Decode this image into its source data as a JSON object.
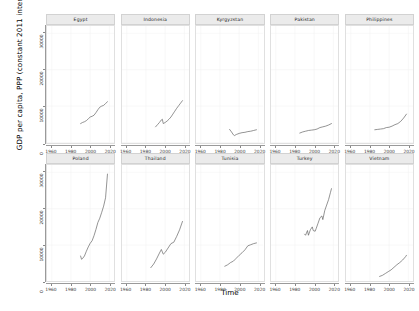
{
  "chart_data": {
    "type": "line",
    "title": "",
    "subtitle": "",
    "xlabel": "Time",
    "ylabel": "GDP per capita, PPP (constant 2011 international $)",
    "xlim": [
      1955,
      2025
    ],
    "ylim": [
      0,
      32000
    ],
    "grid": true,
    "legend": "none",
    "facet_layout": {
      "rows": 2,
      "cols": 5
    },
    "yticks": [
      0,
      10000,
      20000,
      30000
    ],
    "ytick_labels": [
      "0",
      "10000",
      "20000",
      "30000"
    ],
    "xticks": [
      1960,
      1980,
      2000,
      2020
    ],
    "xtick_labels": [
      "1960",
      "1980",
      "2000",
      "2020"
    ],
    "line_color": "#5a5a5a",
    "strip_color": "#ebebeb",
    "panels": [
      {
        "label": "Egypt",
        "x": [
          1990,
          1992,
          1994,
          1996,
          1998,
          2000,
          2002,
          2004,
          2006,
          2008,
          2010,
          2012,
          2014,
          2016,
          2018
        ],
        "y": [
          5200,
          5500,
          5700,
          6000,
          6500,
          7000,
          7200,
          7500,
          8200,
          9000,
          9700,
          10000,
          10200,
          10700,
          11200
        ]
      },
      {
        "label": "Indonesia",
        "x": [
          1990,
          1992,
          1994,
          1996,
          1997,
          1998,
          2000,
          2002,
          2004,
          2006,
          2008,
          2010,
          2012,
          2014,
          2016,
          2018
        ],
        "y": [
          4300,
          4900,
          5500,
          6200,
          6400,
          5200,
          5500,
          5900,
          6400,
          7000,
          7800,
          8600,
          9400,
          10100,
          10800,
          11500
        ]
      },
      {
        "label": "Kyrgyzstan",
        "x": [
          1990,
          1992,
          1994,
          1995,
          1997,
          2000,
          2003,
          2006,
          2009,
          2012,
          2015,
          2018
        ],
        "y": [
          3600,
          2900,
          2100,
          1900,
          2200,
          2500,
          2700,
          2800,
          3000,
          3100,
          3300,
          3500
        ]
      },
      {
        "label": "Pakistan",
        "x": [
          1985,
          1988,
          1991,
          1994,
          1997,
          2000,
          2003,
          2006,
          2009,
          2012,
          2015,
          2018
        ],
        "y": [
          2600,
          2900,
          3100,
          3300,
          3400,
          3500,
          3700,
          4100,
          4300,
          4500,
          4800,
          5200
        ]
      },
      {
        "label": "Philippines",
        "x": [
          1985,
          1988,
          1991,
          1994,
          1997,
          2000,
          2003,
          2006,
          2009,
          2012,
          2015,
          2018
        ],
        "y": [
          3500,
          3600,
          3700,
          3800,
          4100,
          4200,
          4500,
          4900,
          5200,
          5800,
          6700,
          7800
        ]
      },
      {
        "label": "Poland",
        "x": [
          1990,
          1991,
          1992,
          1994,
          1996,
          1998,
          2000,
          2002,
          2004,
          2006,
          2008,
          2010,
          2012,
          2014,
          2016,
          2018
        ],
        "y": [
          7000,
          6100,
          6300,
          7000,
          8300,
          9500,
          10500,
          11200,
          12600,
          14300,
          16200,
          17400,
          19000,
          20700,
          23000,
          29500
        ]
      },
      {
        "label": "Thailand",
        "x": [
          1985,
          1988,
          1991,
          1994,
          1996,
          1998,
          2000,
          2003,
          2006,
          2009,
          2012,
          2015,
          2018
        ],
        "y": [
          3800,
          4800,
          6200,
          7800,
          8800,
          7500,
          8000,
          9200,
          10400,
          10800,
          12400,
          14200,
          16500
        ]
      },
      {
        "label": "Tunisia",
        "x": [
          1985,
          1988,
          1991,
          1994,
          1997,
          2000,
          2003,
          2006,
          2009,
          2012,
          2015,
          2018
        ],
        "y": [
          4200,
          4600,
          5200,
          5600,
          6400,
          7200,
          7900,
          8700,
          9800,
          10100,
          10400,
          10600
        ]
      },
      {
        "label": "Turkey",
        "x": [
          1990,
          1991,
          1993,
          1994,
          1996,
          1998,
          1999,
          2001,
          2002,
          2004,
          2006,
          2008,
          2009,
          2011,
          2013,
          2015,
          2017,
          2018
        ],
        "y": [
          13000,
          12700,
          14000,
          12700,
          14200,
          15000,
          14000,
          13800,
          14500,
          16000,
          17500,
          18000,
          17000,
          19500,
          21000,
          22500,
          24500,
          25500
        ]
      },
      {
        "label": "Vietnam",
        "x": [
          1990,
          1993,
          1996,
          1999,
          2002,
          2005,
          2008,
          2011,
          2014,
          2017,
          2018
        ],
        "y": [
          1400,
          1700,
          2200,
          2700,
          3200,
          3900,
          4600,
          5200,
          5900,
          6800,
          7200
        ]
      }
    ]
  }
}
